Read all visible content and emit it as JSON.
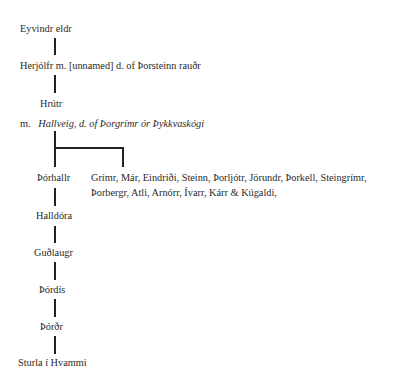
{
  "tree": {
    "gen1": "Eyvindr eldr",
    "gen2": "Herjólfr m. [unnamed] d. of Þorsteinn rauðr",
    "gen3": "Hrútr",
    "marriage_prefix": "m.",
    "marriage_spouse": "Hallveig, d. of Þorgrímr ór Þykkvaskógi",
    "branch_main": "Þórhallr",
    "branch_siblings_line1": "Grímr, Már, Eindriði, Steinn, Þorljótr, Jörundr, Þorkell, Steingrímr,",
    "branch_siblings_line2": "Þorbergr, Atli, Arnórr, Ívarr, Kárr & Kúgaldi,",
    "gen5": "Halldóra",
    "gen6": "Guðlaugr",
    "gen7": "Þórdís",
    "gen8": "Þórðr",
    "gen9": "Sturla í Hvammi"
  }
}
